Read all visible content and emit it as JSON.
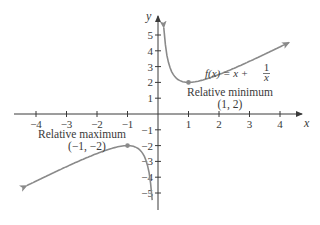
{
  "chart_data": {
    "type": "line",
    "title": "",
    "function_label": "f(x) = x + 1/x",
    "function_label_parts": {
      "lhs": "f(x) = x + ",
      "num": "1",
      "den": "x"
    },
    "xlabel": "x",
    "ylabel": "y",
    "xlim": [
      -4.3,
      4.3
    ],
    "ylim": [
      -5.2,
      5.2
    ],
    "grid": false,
    "x_ticks": [
      -4,
      -3,
      -2,
      -1,
      1,
      2,
      3,
      4
    ],
    "y_ticks": [
      5,
      4,
      3,
      2,
      1,
      -1,
      -2,
      -3,
      -4,
      -5
    ],
    "x_tick_labels": [
      "−4",
      "−3",
      "−2",
      "−1",
      "1",
      "2",
      "3",
      "4"
    ],
    "y_tick_labels": [
      "5",
      "4",
      "3",
      "2",
      "1",
      "−1",
      "−2",
      "−3",
      "−4",
      "−5"
    ],
    "series": [
      {
        "name": "f(x) = x + 1/x (x > 0)",
        "x": [
          0.19,
          0.25,
          0.33,
          0.5,
          0.75,
          1,
          1.5,
          2,
          2.5,
          3,
          3.5,
          4,
          4.3
        ],
        "y": [
          5.45,
          4.25,
          3.36,
          2.5,
          2.08,
          2,
          2.17,
          2.5,
          2.9,
          3.33,
          3.79,
          4.25,
          4.53
        ]
      },
      {
        "name": "f(x) = x + 1/x (x < 0)",
        "x": [
          -4.3,
          -4,
          -3.5,
          -3,
          -2.5,
          -2,
          -1.5,
          -1,
          -0.75,
          -0.5,
          -0.33,
          -0.25,
          -0.19
        ],
        "y": [
          -4.53,
          -4.25,
          -3.79,
          -3.33,
          -2.9,
          -2.5,
          -2.17,
          -2,
          -2.08,
          -2.5,
          -3.36,
          -4.25,
          -5.45
        ]
      }
    ],
    "annotations": [
      {
        "label": "Relative minimum",
        "point_label": "(1, 2)",
        "x": 1,
        "y": 2
      },
      {
        "label": "Relative maximum",
        "point_label": "(−1, −2)",
        "x": -1,
        "y": -2
      }
    ],
    "colors": {
      "curve": "#8a8a8a",
      "axis": "#3a3a3a",
      "text": "#3a3a3a"
    }
  }
}
